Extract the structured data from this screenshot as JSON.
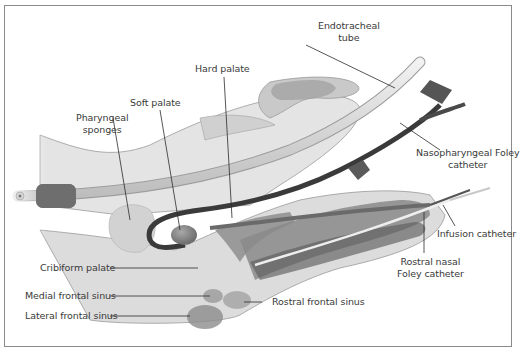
{
  "figure": {
    "type": "anatomical-diagram",
    "colors": {
      "tissue_light": "#e2e2e2",
      "tissue_mid": "#cfcfcf",
      "tissue_dark": "#8e8e8e",
      "tube_fill": "#e6e6e6",
      "catheter_dark": "#4a4a4a",
      "leader_line": "#2b2b2b",
      "frame": "#8a8a8a"
    },
    "labels": {
      "endotracheal_tube": [
        "Endotracheal",
        "tube"
      ],
      "hard_palate": "Hard palate",
      "soft_palate": "Soft palate",
      "pharyngeal_sponges": [
        "Pharyngeal",
        "sponges"
      ],
      "nasopharyngeal_foley": [
        "Nasopharyngeal Foley",
        "catheter"
      ],
      "infusion_catheter": "Infusion catheter",
      "rostral_nasal_foley": [
        "Rostral nasal",
        "Foley catheter"
      ],
      "cribiform_palate": "Cribiform palate",
      "medial_frontal_sinus": "Medial frontal sinus",
      "lateral_frontal_sinus": "Lateral frontal sinus",
      "rostral_frontal_sinus": "Rostral frontal sinus"
    }
  }
}
